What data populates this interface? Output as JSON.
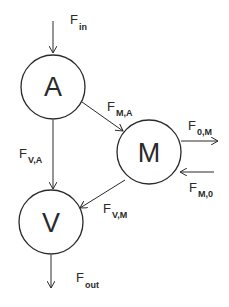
{
  "diagram": {
    "type": "compartment-flow",
    "nodes": [
      {
        "id": "A",
        "label": "A"
      },
      {
        "id": "M",
        "label": "M"
      },
      {
        "id": "V",
        "label": "V"
      }
    ],
    "fluxes": [
      {
        "id": "in",
        "main": "F",
        "sub": "in",
        "from": "",
        "to": "A"
      },
      {
        "id": "MA",
        "main": "F",
        "sub": "M,A",
        "from": "A",
        "to": "M"
      },
      {
        "id": "VA",
        "main": "F",
        "sub": "V,A",
        "from": "A",
        "to": "V"
      },
      {
        "id": "0M",
        "main": "F",
        "sub": "0,M",
        "from": "M",
        "to": ""
      },
      {
        "id": "M0",
        "main": "F",
        "sub": "M,0",
        "from": "",
        "to": "M"
      },
      {
        "id": "VM",
        "main": "F",
        "sub": "V,M",
        "from": "M",
        "to": "V"
      },
      {
        "id": "out",
        "main": "F",
        "sub": "out",
        "from": "V",
        "to": ""
      }
    ],
    "colors": {
      "stroke": "#2a2a2a",
      "background": "#ffffff"
    }
  }
}
